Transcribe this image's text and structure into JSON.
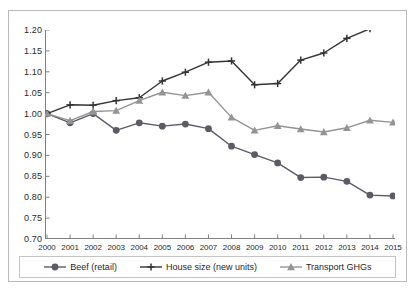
{
  "chart_data": {
    "type": "line",
    "title": "",
    "subtitle": "",
    "xlabel": "",
    "ylabel": "",
    "categories": [
      "2000",
      "2001",
      "2002",
      "2003",
      "2004",
      "2005",
      "2006",
      "2007",
      "2008",
      "2009",
      "2010",
      "2011",
      "2012",
      "2013",
      "2014",
      "2015"
    ],
    "x": [
      2000,
      2001,
      2002,
      2003,
      2004,
      2005,
      2006,
      2007,
      2008,
      2009,
      2010,
      2011,
      2012,
      2013,
      2014,
      2015
    ],
    "ylim": [
      0.7,
      1.2
    ],
    "ytick_labels": [
      "1.20",
      "1.15",
      "1.10",
      "1.05",
      "1.00",
      "0.95",
      "0.90",
      "0.85",
      "0.80",
      "0.75",
      "0.70"
    ],
    "ytick_values": [
      1.2,
      1.15,
      1.1,
      1.05,
      1.0,
      0.95,
      0.9,
      0.85,
      0.8,
      0.75,
      0.7
    ],
    "grid": false,
    "legend_position": "bottom",
    "series": [
      {
        "name": "Beef (retail)",
        "marker": "circle",
        "color": "#5c5c68",
        "values": [
          1.0,
          0.978,
          1.0,
          0.96,
          0.978,
          0.97,
          0.975,
          0.964,
          0.922,
          0.902,
          0.882,
          0.847,
          0.848,
          0.838,
          0.805,
          0.803
        ]
      },
      {
        "name": "House size (new units)",
        "marker": "plus",
        "color": "#333333",
        "values": [
          1.0,
          1.021,
          1.02,
          1.031,
          1.038,
          1.078,
          1.099,
          1.123,
          1.126,
          1.069,
          1.072,
          1.128,
          1.145,
          1.18,
          1.203,
          1.218
        ]
      },
      {
        "name": "Transport GHGs",
        "marker": "triangle",
        "color": "#949494",
        "values": [
          1.0,
          0.983,
          1.005,
          1.007,
          1.031,
          1.051,
          1.043,
          1.051,
          0.991,
          0.96,
          0.971,
          0.963,
          0.956,
          0.966,
          0.984,
          0.979
        ]
      }
    ]
  },
  "legend": {
    "entries": [
      {
        "label": "Beef (retail)"
      },
      {
        "label": "House size (new units)"
      },
      {
        "label": "Transport GHGs"
      }
    ]
  },
  "axis_colors": {
    "axis_line": "#808080",
    "frame": "#b9b9b9",
    "tick_text": "#2a2a2a"
  }
}
